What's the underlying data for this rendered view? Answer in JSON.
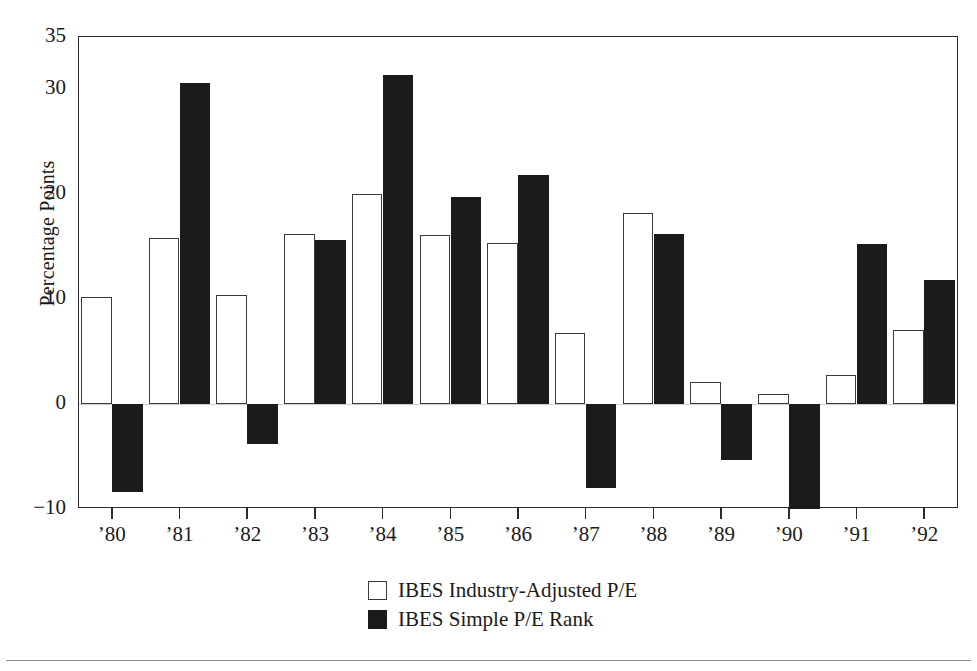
{
  "chart_data": {
    "type": "bar",
    "title": "",
    "xlabel": "",
    "ylabel": "Percentage Points",
    "categories": [
      "'80",
      "'81",
      "'82",
      "'83",
      "'84",
      "'85",
      "'86",
      "'87",
      "'88",
      "'89",
      "'90",
      "'91",
      "'92"
    ],
    "ylim": [
      -10,
      35
    ],
    "yticks": [
      35,
      30,
      20,
      10,
      0,
      -10
    ],
    "ytick_labels": [
      "35",
      "30",
      "20",
      "10",
      "0",
      "−10"
    ],
    "grid": false,
    "legend_position": "bottom-center",
    "series": [
      {
        "name": "IBES Industry-Adjusted P/E",
        "color": "#ffffff",
        "edge_color": "#3a3a3a",
        "values": [
          10.2,
          15.8,
          10.4,
          16.2,
          20.0,
          16.1,
          15.4,
          6.8,
          18.2,
          2.1,
          1.0,
          2.8,
          7.1
        ]
      },
      {
        "name": "IBES Simple P/E Rank",
        "color": "#1b1b1b",
        "edge_color": "#1b1b1b",
        "values": [
          -8.4,
          30.6,
          -3.8,
          15.6,
          31.4,
          19.7,
          21.8,
          -8.0,
          16.2,
          -5.3,
          -10.0,
          15.3,
          11.8
        ]
      }
    ]
  },
  "legend": {
    "items": [
      {
        "label": "IBES Industry-Adjusted P/E",
        "swatch": "white"
      },
      {
        "label": "IBES Simple P/E Rank",
        "swatch": "black"
      }
    ]
  },
  "axis": {
    "y_title": "Percentage Points"
  }
}
